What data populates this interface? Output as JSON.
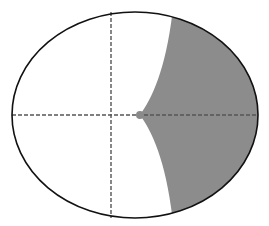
{
  "diagram": {
    "ellipse": {
      "cx": 135,
      "cy": 115,
      "rx": 123,
      "ry": 103,
      "stroke": "#111111",
      "fill": "#ffffff"
    },
    "axes": {
      "horizontal": {
        "y": 115,
        "x1": 12,
        "x2": 258
      },
      "vertical": {
        "x": 111,
        "y1": 12,
        "y2": 218
      },
      "stroke": "#555555",
      "dash": "4,2"
    },
    "shaded_region": {
      "fill": "#8c8c8c",
      "cusp": {
        "x": 140,
        "y": 115
      },
      "top_boundary_x": 172,
      "bottom_boundary_x": 172
    },
    "point": {
      "x": 140,
      "y": 115,
      "r": 4,
      "fill": "#8a8a8a"
    }
  }
}
